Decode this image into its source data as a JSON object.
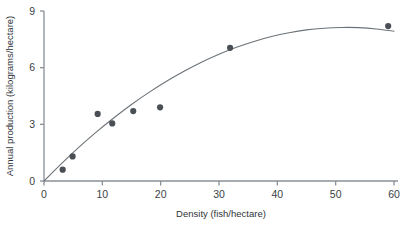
{
  "chart_data": {
    "type": "scatter",
    "title": "",
    "xlabel": "Density (fish/hectare)",
    "ylabel": "Annual production (kilograms/hectare)",
    "xlim": [
      0,
      60
    ],
    "ylim": [
      0,
      9
    ],
    "xticks": [
      0,
      10,
      20,
      30,
      40,
      50,
      60
    ],
    "yticks": [
      0,
      3,
      6,
      9
    ],
    "grid": false,
    "legend": null,
    "point_color": "#4a4f55",
    "line_color": "#6c7378",
    "axis_color": "#8a9096",
    "points": [
      {
        "x": 3.2,
        "y": 0.6
      },
      {
        "x": 4.9,
        "y": 1.3
      },
      {
        "x": 9.2,
        "y": 3.55
      },
      {
        "x": 11.7,
        "y": 3.05
      },
      {
        "x": 15.3,
        "y": 3.7
      },
      {
        "x": 19.9,
        "y": 3.9
      },
      {
        "x": 31.9,
        "y": 7.05
      },
      {
        "x": 59.0,
        "y": 8.2
      }
    ],
    "fit_curve": {
      "name": "fitted curve",
      "x": [
        0,
        3,
        6,
        9,
        12,
        15,
        18,
        21,
        24,
        27,
        30,
        33,
        36,
        39,
        42,
        45,
        48,
        51,
        54,
        57,
        60
      ],
      "y": [
        0,
        0.92,
        1.79,
        2.6,
        3.35,
        4.05,
        4.69,
        5.28,
        5.81,
        6.29,
        6.71,
        7.08,
        7.39,
        7.65,
        7.85,
        8.0,
        8.09,
        8.13,
        8.12,
        8.05,
        7.93
      ]
    }
  },
  "axes": {
    "x_tick_labels": [
      "0",
      "10",
      "20",
      "30",
      "40",
      "50",
      "60"
    ],
    "y_tick_labels": [
      "0",
      "3",
      "6",
      "9"
    ],
    "x_axis_title": "Density (fish/hectare)",
    "y_axis_title": "Annual production (kilograms/hectare)"
  }
}
